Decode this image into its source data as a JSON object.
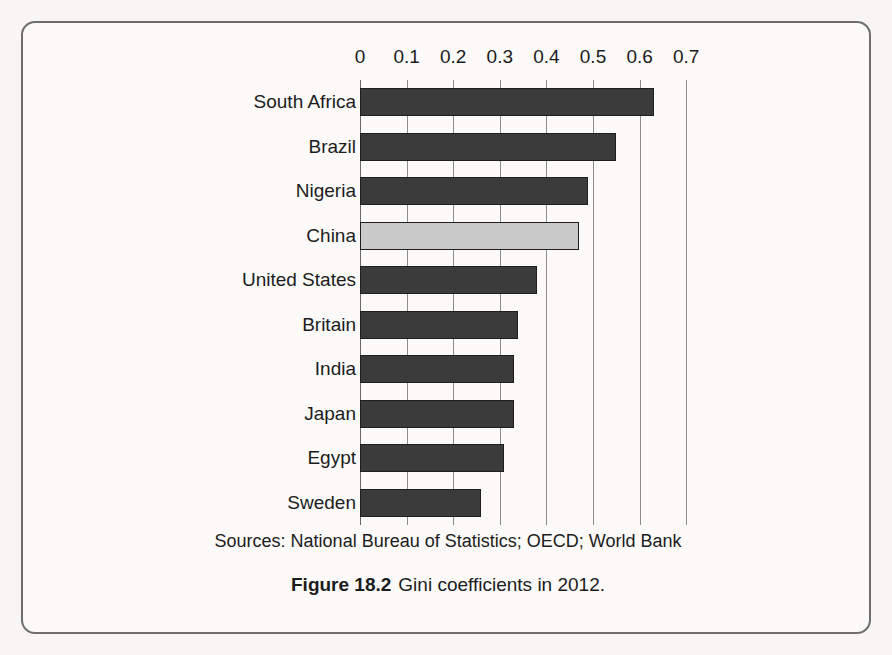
{
  "figure": {
    "caption_label": "Figure 18.2",
    "caption_text": "Gini coefficients in 2012.",
    "source_line": "Sources: National Bureau of Statistics; OECD; World Bank"
  },
  "colors": {
    "bar_default": "#3b3b3b",
    "bar_highlight": "#c9c9c9",
    "bar_outline": "#1f1f1f",
    "gridline": "#8d8d8d",
    "card_border": "#6e6e6e",
    "page_background": "#f7f6f4",
    "card_background": "#fbfaf9"
  },
  "chart_data": {
    "type": "bar",
    "orientation": "horizontal",
    "title": "Gini coefficients in 2012",
    "xlabel": "",
    "ylabel": "",
    "xlim": [
      0,
      0.7
    ],
    "grid": true,
    "legend": "none",
    "tick_labels": [
      "0",
      "0.1",
      "0.2",
      "0.3",
      "0.4",
      "0.5",
      "0.6",
      "0.7"
    ],
    "ticks": [
      0,
      0.1,
      0.2,
      0.3,
      0.4,
      0.5,
      0.6,
      0.7
    ],
    "categories": [
      "South Africa",
      "Brazil",
      "Nigeria",
      "China",
      "United States",
      "Britain",
      "India",
      "Japan",
      "Egypt",
      "Sweden"
    ],
    "values": [
      0.63,
      0.55,
      0.49,
      0.47,
      0.38,
      0.34,
      0.33,
      0.33,
      0.31,
      0.26
    ],
    "highlight_category": "China",
    "points": [
      {
        "label": "South Africa",
        "value": 0.63,
        "highlight": false
      },
      {
        "label": "Brazil",
        "value": 0.55,
        "highlight": false
      },
      {
        "label": "Nigeria",
        "value": 0.49,
        "highlight": false
      },
      {
        "label": "China",
        "value": 0.47,
        "highlight": true
      },
      {
        "label": "United States",
        "value": 0.38,
        "highlight": false
      },
      {
        "label": "Britain",
        "value": 0.34,
        "highlight": false
      },
      {
        "label": "India",
        "value": 0.33,
        "highlight": false
      },
      {
        "label": "Japan",
        "value": 0.33,
        "highlight": false
      },
      {
        "label": "Egypt",
        "value": 0.31,
        "highlight": false
      },
      {
        "label": "Sweden",
        "value": 0.26,
        "highlight": false
      }
    ]
  }
}
